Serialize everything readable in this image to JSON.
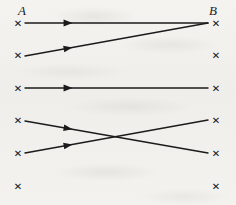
{
  "figure": {
    "width": 236,
    "height": 205,
    "background_color": "#f2f1ee",
    "ink_color": "#1b1b1b"
  },
  "labels": {
    "left_set": "A",
    "right_set": "B",
    "left_set_x": 18,
    "left_set_y": 4,
    "right_set_x": 209,
    "right_set_y": 4
  },
  "node_glyph": "✕",
  "nodes": {
    "left": [
      {
        "id": "a1",
        "x": 18,
        "y": 23
      },
      {
        "id": "a2",
        "x": 18,
        "y": 55
      },
      {
        "id": "a3",
        "x": 18,
        "y": 88
      },
      {
        "id": "a4",
        "x": 18,
        "y": 120
      },
      {
        "id": "a5",
        "x": 18,
        "y": 153
      },
      {
        "id": "a6",
        "x": 18,
        "y": 186
      }
    ],
    "right": [
      {
        "id": "b1",
        "x": 216,
        "y": 23
      },
      {
        "id": "b2",
        "x": 216,
        "y": 55
      },
      {
        "id": "b3",
        "x": 216,
        "y": 88
      },
      {
        "id": "b4",
        "x": 216,
        "y": 120
      },
      {
        "id": "b5",
        "x": 216,
        "y": 153
      },
      {
        "id": "b6",
        "x": 216,
        "y": 186
      }
    ]
  },
  "edges": [
    {
      "id": "edge-a1-b1",
      "from": "a1",
      "to": "b1",
      "x1": 25,
      "y1": 23,
      "x2": 208,
      "y2": 23,
      "arrow_t": 0.26
    },
    {
      "id": "edge-a2-b1",
      "from": "a2",
      "to": "b1",
      "x1": 25,
      "y1": 56,
      "x2": 208,
      "y2": 23,
      "arrow_t": 0.26
    },
    {
      "id": "edge-a3-b3",
      "from": "a3",
      "to": "b3",
      "x1": 25,
      "y1": 88,
      "x2": 208,
      "y2": 88,
      "arrow_t": 0.26
    },
    {
      "id": "edge-a4-b5",
      "from": "a4",
      "to": "b5",
      "x1": 25,
      "y1": 121,
      "x2": 208,
      "y2": 153,
      "arrow_t": 0.26
    },
    {
      "id": "edge-a5-b4",
      "from": "a5",
      "to": "b4",
      "x1": 25,
      "y1": 153,
      "x2": 208,
      "y2": 120,
      "arrow_t": 0.26
    }
  ],
  "style": {
    "line_width": 1.4,
    "arrow_length": 9,
    "arrow_half_width": 3.4,
    "node_size": 9
  }
}
